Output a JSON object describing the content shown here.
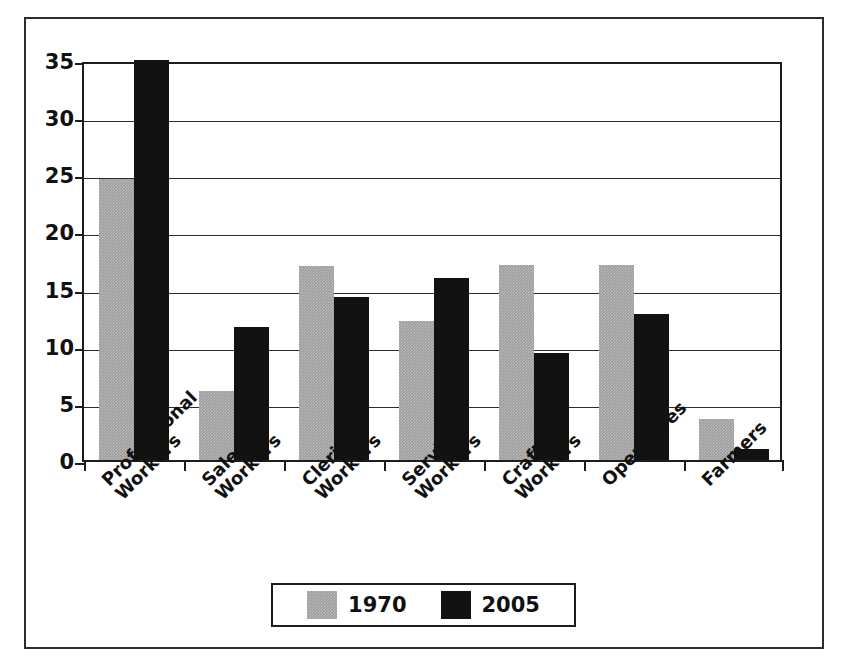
{
  "chart_data": {
    "type": "bar",
    "title": "",
    "xlabel": "",
    "ylabel": "Percent",
    "ylim": [
      0,
      35
    ],
    "yticks": [
      0,
      5,
      10,
      15,
      20,
      25,
      30,
      35
    ],
    "grid": true,
    "legend_position": "bottom",
    "categories": [
      "Professional Workers",
      "Sales Workers",
      "Clerical Workers",
      "Service Workers",
      "Craft Workers",
      "Operatives",
      "Farmers"
    ],
    "category_lines": [
      [
        "Professional",
        "Workers"
      ],
      [
        "Sales",
        "Workers"
      ],
      [
        "Clerical",
        "Workers"
      ],
      [
        "Service",
        "Workers"
      ],
      [
        "Craft",
        "Workers"
      ],
      [
        "Operatives"
      ],
      [
        "Farmers"
      ]
    ],
    "series": [
      {
        "name": "1970",
        "color": "#9c9c9c",
        "values": [
          24.6,
          6.0,
          17.0,
          12.2,
          17.1,
          17.1,
          3.6
        ]
      },
      {
        "name": "2005",
        "color": "#121212",
        "values": [
          35.0,
          11.6,
          14.3,
          15.9,
          9.4,
          12.8,
          1.0
        ]
      }
    ]
  },
  "axis": {
    "y_title": "Percent",
    "y_tick_labels": [
      "35",
      "30",
      "25",
      "20",
      "15",
      "10",
      "5",
      "0"
    ]
  },
  "legend": {
    "entries": [
      {
        "label": "1970",
        "swatch": "gray-swatch"
      },
      {
        "label": "2005",
        "swatch": "black-swatch"
      }
    ]
  }
}
